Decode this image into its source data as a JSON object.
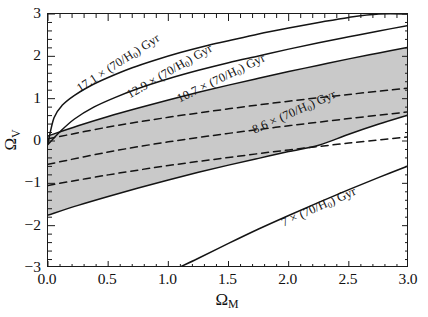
{
  "figure": {
    "kind": "cosmology-age-contour-plot",
    "background": "#ffffff",
    "axis_color": "#1a1a1a",
    "shade_color": "#c9c9c9"
  },
  "axes": {
    "x": {
      "label_main": "Ω",
      "label_sub": "M",
      "min": 0.0,
      "max": 3.0,
      "major_ticks": [
        0.0,
        0.5,
        1.0,
        1.5,
        2.0,
        2.5,
        3.0
      ],
      "major_tick_labels": [
        "0.0",
        "0.5",
        "1.0",
        "1.5",
        "2.0",
        "2.5",
        "3.0"
      ],
      "minor_tick_step": 0.1
    },
    "y": {
      "label_main": "Ω",
      "label_sub": "V",
      "min": -3,
      "max": 3,
      "major_ticks": [
        -3,
        -2,
        -1,
        0,
        1,
        2,
        3
      ],
      "major_tick_labels": [
        "−3",
        "−2",
        "−1",
        "0",
        "1",
        "2",
        "3"
      ],
      "minor_tick_step": 0.2
    },
    "grid": false,
    "legend": "none"
  },
  "annotations": [
    {
      "name": "age-label-17p1",
      "text_value": "17.1",
      "text_times": "× (70/H",
      "text_sub": "0",
      "text_tail": ") Gyr",
      "full": "17.1 × (70/H0) Gyr",
      "x_px": 78,
      "y_px": 82,
      "rotation_deg": -33
    },
    {
      "name": "age-label-12p9",
      "text_value": "12.9",
      "text_times": "× (70/H",
      "text_sub": "0",
      "text_tail": ") Gyr",
      "full": "12.9 × (70/H0) Gyr",
      "x_px": 128,
      "y_px": 88,
      "rotation_deg": -30
    },
    {
      "name": "age-label-10p7",
      "text_value": "10.7",
      "text_times": "× (70/H",
      "text_sub": "0",
      "text_tail": ") Gyr",
      "full": "10.7 × (70/H0) Gyr",
      "x_px": 178,
      "y_px": 92,
      "rotation_deg": -26
    },
    {
      "name": "age-label-8p6",
      "text_value": "8.6",
      "text_times": "× (70/H",
      "text_sub": "0",
      "text_tail": ") Gyr",
      "full": "8.6 × (70/H0) Gyr",
      "x_px": 253,
      "y_px": 123,
      "rotation_deg": -24
    },
    {
      "name": "age-label-7",
      "text_value": "7",
      "text_times": "× (70/H",
      "text_sub": "0",
      "text_tail": ") Gyr",
      "full": "7 × (70/H0) Gyr",
      "x_px": 282,
      "y_px": 216,
      "rotation_deg": -24
    }
  ],
  "chart_data": {
    "type": "line",
    "title": "",
    "xlabel": "Ω_M",
    "ylabel": "Ω_V",
    "xlim": [
      0.0,
      3.0
    ],
    "ylim": [
      -3,
      3
    ],
    "grid": false,
    "legend_position": "inline-curve-labels",
    "shaded_band": {
      "name": "allowed-age-region",
      "color": "#c9c9c9",
      "description": "grey shaded band between the 10.7 and 8.6 Gyr age contours",
      "upper_boundary_x": [
        0.0,
        0.25,
        0.5,
        0.75,
        1.0,
        1.25,
        1.5,
        1.75,
        2.0,
        2.25,
        2.5,
        2.75,
        3.0
      ],
      "upper_boundary_y": [
        0.12,
        0.36,
        0.58,
        0.78,
        0.97,
        1.15,
        1.32,
        1.48,
        1.64,
        1.79,
        1.94,
        2.08,
        2.22
      ],
      "lower_boundary_x": [
        0.0,
        0.25,
        0.5,
        0.75,
        1.0,
        1.25,
        1.5,
        1.75,
        2.0,
        2.25,
        2.5,
        2.75,
        3.0
      ],
      "lower_boundary_y": [
        -1.75,
        -1.52,
        -1.31,
        -1.11,
        -0.92,
        -0.74,
        -0.57,
        -0.41,
        -0.25,
        -0.1,
        0.16,
        0.4,
        0.62
      ]
    },
    "series": [
      {
        "name": "17.1 Gyr contour",
        "label": "17.1 × (70/H0) Gyr",
        "style": "solid",
        "x": [
          0.0,
          0.05,
          0.12,
          0.22,
          0.35,
          0.5,
          0.7,
          0.9,
          1.1,
          1.3,
          1.5,
          1.75,
          2.0,
          2.25,
          2.5,
          2.75,
          3.0
        ],
        "y": [
          -0.05,
          0.55,
          0.85,
          1.08,
          1.3,
          1.5,
          1.73,
          1.92,
          2.09,
          2.24,
          2.37,
          2.53,
          2.67,
          2.8,
          2.92,
          3.0,
          3.0
        ]
      },
      {
        "name": "12.9 Gyr contour",
        "label": "12.9 × (70/H0) Gyr",
        "style": "solid",
        "x": [
          0.0,
          0.1,
          0.22,
          0.38,
          0.55,
          0.75,
          1.0,
          1.25,
          1.5,
          1.75,
          2.0,
          2.25,
          2.5,
          2.75,
          3.0
        ],
        "y": [
          -0.08,
          0.22,
          0.52,
          0.8,
          1.02,
          1.24,
          1.47,
          1.67,
          1.85,
          2.01,
          2.17,
          2.32,
          2.46,
          2.6,
          2.73
        ]
      },
      {
        "name": "10.7 Gyr contour",
        "label": "10.7 × (70/H0) Gyr",
        "style": "solid",
        "x": [
          0.0,
          0.25,
          0.5,
          0.75,
          1.0,
          1.25,
          1.5,
          1.75,
          2.0,
          2.25,
          2.5,
          2.75,
          3.0
        ],
        "y": [
          0.12,
          0.36,
          0.58,
          0.78,
          0.97,
          1.15,
          1.32,
          1.48,
          1.64,
          1.79,
          1.94,
          2.08,
          2.22
        ]
      },
      {
        "name": "8.6 Gyr contour",
        "label": "8.6 × (70/H0) Gyr",
        "style": "solid",
        "x": [
          0.0,
          0.25,
          0.5,
          0.75,
          1.0,
          1.25,
          1.5,
          1.75,
          2.0,
          2.25,
          2.5,
          2.75,
          3.0
        ],
        "y": [
          -1.75,
          -1.52,
          -1.31,
          -1.11,
          -0.92,
          -0.74,
          -0.57,
          -0.41,
          -0.25,
          -0.1,
          0.16,
          0.4,
          0.62
        ]
      },
      {
        "name": "7 Gyr contour",
        "label": "7 × (70/H0) Gyr",
        "style": "solid",
        "x": [
          1.08,
          1.25,
          1.5,
          1.75,
          2.0,
          2.25,
          2.5,
          2.75,
          3.0
        ],
        "y": [
          -3.0,
          -2.77,
          -2.42,
          -2.08,
          -1.76,
          -1.45,
          -1.15,
          -0.86,
          -0.58
        ]
      },
      {
        "name": "dashed line upper",
        "label": "",
        "style": "dashed",
        "x": [
          0.0,
          0.5,
          1.0,
          1.5,
          2.0,
          2.5,
          3.0
        ],
        "y": [
          0.05,
          0.33,
          0.56,
          0.76,
          0.94,
          1.1,
          1.25
        ]
      },
      {
        "name": "dashed line middle",
        "label": "",
        "style": "dashed",
        "x": [
          0.0,
          0.5,
          1.0,
          1.5,
          2.0,
          2.5,
          3.0
        ],
        "y": [
          -0.55,
          -0.26,
          -0.02,
          0.18,
          0.36,
          0.53,
          0.69
        ]
      },
      {
        "name": "dashed line lower",
        "label": "",
        "style": "dashed",
        "x": [
          0.0,
          0.5,
          1.0,
          1.5,
          2.0,
          2.5,
          3.0
        ],
        "y": [
          -1.05,
          -0.8,
          -0.58,
          -0.39,
          -0.21,
          -0.05,
          0.1
        ]
      }
    ]
  }
}
